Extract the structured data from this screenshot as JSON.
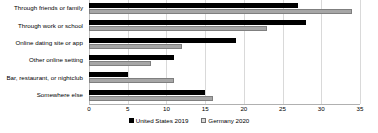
{
  "chart_data": {
    "type": "bar",
    "orientation": "horizontal",
    "title": "",
    "xlabel": "",
    "ylabel": "",
    "xlim": [
      0,
      35
    ],
    "xticks": [
      0,
      5,
      10,
      15,
      20,
      25,
      30,
      35
    ],
    "grid": true,
    "legend_position": "bottom",
    "categories": [
      "Through friends or family",
      "Through work or school",
      "Online dating site or app",
      "Other online setting",
      "Bar, restaurant, or nightclub",
      "Somewhere else"
    ],
    "series": [
      {
        "name": "United States 2019",
        "color": "#000000",
        "values": [
          27,
          28,
          19,
          11,
          5,
          15
        ]
      },
      {
        "name": "Germany 2020",
        "color": "#a6a6a6",
        "values": [
          34,
          23,
          12,
          8,
          11,
          16
        ]
      }
    ]
  }
}
